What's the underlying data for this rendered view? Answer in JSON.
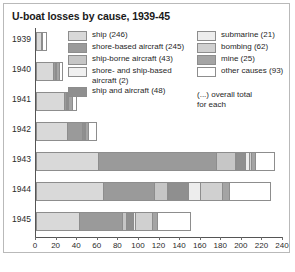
{
  "chart_data": {
    "type": "bar",
    "orientation": "horizontal",
    "stacked": true,
    "title": "U-boat losses by cause, 1939-45",
    "xlabel": "",
    "ylabel": "",
    "xlim": [
      0,
      240
    ],
    "xticks": [
      0,
      20,
      40,
      60,
      80,
      100,
      120,
      140,
      160,
      180,
      200,
      220,
      240
    ],
    "grid": false,
    "legend_position": "inside-top-right",
    "categories": [
      "1939",
      "1940",
      "1941",
      "1942",
      "1943",
      "1944",
      "1945"
    ],
    "series": [
      {
        "name": "ship (246)",
        "total": 246,
        "color": "#d9d9d9",
        "values": [
          5,
          17,
          27,
          30,
          60,
          65,
          42
        ]
      },
      {
        "name": "shore-based aircraft (245)",
        "total": 245,
        "color": "#9a9a9a",
        "values": [
          0,
          1,
          2,
          15,
          115,
          50,
          42
        ]
      },
      {
        "name": "ship-borne aircraft (43)",
        "total": 43,
        "color": "#c6c6c6",
        "values": [
          0,
          0,
          0,
          0,
          18,
          12,
          3
        ]
      },
      {
        "name": "shore- and ship-based aircraft (2)",
        "total": 2,
        "color": "#f0f0f0",
        "values": [
          0,
          0,
          0,
          0,
          1,
          1,
          0
        ]
      },
      {
        "name": "ship and aircraft (48)",
        "total": 48,
        "color": "#8f8f8f",
        "values": [
          0,
          1,
          1,
          2,
          9,
          20,
          7
        ]
      },
      {
        "name": "submarine (21)",
        "total": 21,
        "color": "#ededed",
        "values": [
          0,
          0,
          1,
          1,
          4,
          11,
          2
        ]
      },
      {
        "name": "bombing (62)",
        "total": 62,
        "color": "#d0d0d0",
        "values": [
          0,
          0,
          0,
          0,
          2,
          22,
          17
        ]
      },
      {
        "name": "mine (25)",
        "total": 25,
        "color": "#a4a4a4",
        "values": [
          1,
          3,
          4,
          3,
          4,
          7,
          5
        ]
      },
      {
        "name": "other causes (93)",
        "total": 93,
        "color": "#ffffff",
        "values": [
          3,
          2,
          3,
          6,
          17,
          38,
          31
        ]
      }
    ],
    "totals": [
      9,
      24,
      38,
      57,
      230,
      226,
      149
    ],
    "annotation": "(...) overall total\nfor each"
  },
  "legend": {
    "left_column": [
      {
        "label": "ship (246)",
        "color": "#d9d9d9"
      },
      {
        "label": "shore-based aircraft (245)",
        "color": "#9a9a9a"
      },
      {
        "label": "ship-borne aircraft (43)",
        "color": "#c6c6c6"
      },
      {
        "label": "shore- and ship-based\naircraft (2)",
        "color": "#f0f0f0"
      },
      {
        "label": "ship and aircraft (48)",
        "color": "#8f8f8f"
      }
    ],
    "right_column": [
      {
        "label": "submarine (21)",
        "color": "#ededed"
      },
      {
        "label": "bombing (62)",
        "color": "#d0d0d0"
      },
      {
        "label": "mine (25)",
        "color": "#a4a4a4"
      },
      {
        "label": "other causes (93)",
        "color": "#ffffff"
      }
    ],
    "note": "(...) overall total\nfor each"
  },
  "colors": {
    "frame": "#b9b9b9",
    "axis": "#555555",
    "segment_border": "#8d8d8d",
    "text": "#1f1f1f",
    "background": "#ffffff"
  }
}
